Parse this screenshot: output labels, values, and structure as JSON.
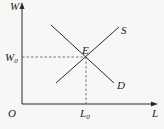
{
  "diagram": {
    "type": "supply-demand",
    "axes": {
      "y_label": "W",
      "x_label": "L",
      "origin_label": "O"
    },
    "curves": [
      {
        "name": "S",
        "label": "S",
        "from": [
          56,
          83
        ],
        "to": [
          119,
          27
        ]
      },
      {
        "name": "D",
        "label": "D",
        "from": [
          51,
          25
        ],
        "to": [
          114,
          83
        ]
      }
    ],
    "equilibrium": {
      "label": "E",
      "point": [
        86,
        57
      ],
      "wage_label": "W",
      "wage_subscript": "0",
      "quantity_label": "L",
      "quantity_subscript": "0"
    },
    "colors": {
      "line": "#2a2a2a",
      "dashed": "#555555",
      "background": "#f7f7f5"
    }
  }
}
